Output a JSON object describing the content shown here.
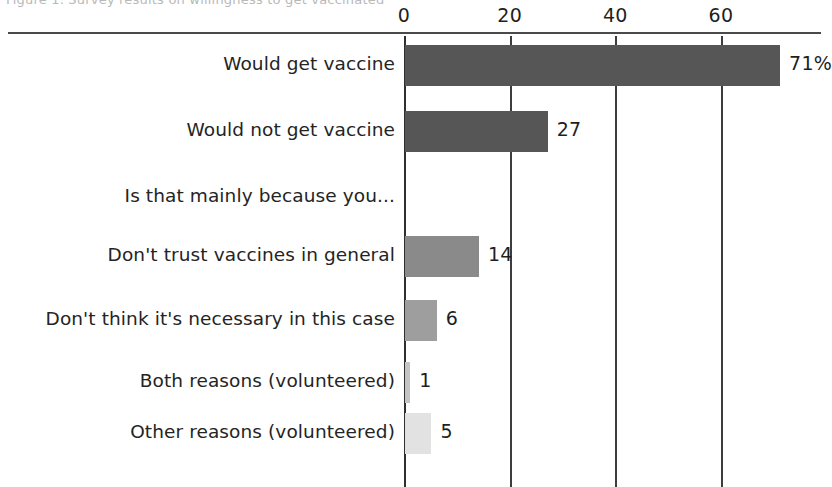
{
  "chart_data": {
    "type": "bar",
    "orientation": "horizontal",
    "title": "",
    "xlabel": "",
    "ylabel": "",
    "xlim": [
      0,
      75
    ],
    "xticks": [
      0,
      20,
      40,
      60
    ],
    "xtick_labels": [
      "0",
      "20",
      "40",
      "60"
    ],
    "grid": true,
    "legend": "none",
    "categories": [
      "Would get vaccine",
      "Would not get vaccine",
      "Is that mainly because you...",
      "Don't trust vaccines in general",
      "Don't think it's necessary in this case",
      "Both reasons (volunteered)",
      "Other reasons (volunteered)"
    ],
    "values": [
      71,
      27,
      null,
      14,
      6,
      1,
      5
    ],
    "value_labels": [
      "71%",
      "27",
      "",
      "14",
      "6",
      "1",
      "5"
    ],
    "bar_colors": [
      "#565656",
      "#565656",
      "",
      "#8a8a8a",
      "#9e9e9e",
      "#c4c4c4",
      "#e2e2e2"
    ]
  },
  "faint_header": {
    "text": "Figure 1. Survey results on willingness to get vaccinated"
  },
  "rows": [
    {
      "label": "Would get vaccine",
      "value": 71,
      "value_label": "71%",
      "color": "#565656",
      "is_header": false
    },
    {
      "label": "Would not get vaccine",
      "value": 27,
      "value_label": "27",
      "color": "#565656",
      "is_header": false
    },
    {
      "label": "Is that mainly because you...",
      "value": null,
      "value_label": "",
      "color": "",
      "is_header": true
    },
    {
      "label": "Don't trust vaccines in general",
      "value": 14,
      "value_label": "14",
      "color": "#8a8a8a",
      "is_header": false
    },
    {
      "label": "Don't think it's necessary in this case",
      "value": 6,
      "value_label": "6",
      "color": "#9e9e9e",
      "is_header": false
    },
    {
      "label": "Both reasons (volunteered)",
      "value": 1,
      "value_label": "1",
      "color": "#c4c4c4",
      "is_header": false
    },
    {
      "label": "Other reasons (volunteered)",
      "value": 5,
      "value_label": "5",
      "color": "#e2e2e2",
      "is_header": false
    }
  ],
  "axis": {
    "ticks": [
      {
        "label": "0",
        "value": 0
      },
      {
        "label": "20",
        "value": 20
      },
      {
        "label": "40",
        "value": 40
      },
      {
        "label": "60",
        "value": 60
      }
    ]
  }
}
